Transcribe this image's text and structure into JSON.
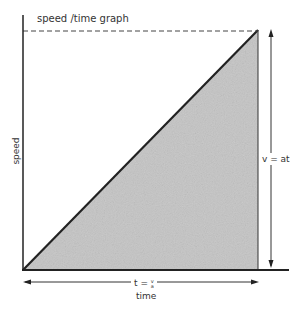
{
  "diagram": {
    "title": "speed /time graph",
    "y_axis_label": "speed",
    "x_axis_label": "time",
    "velocity_annotation": "v = at",
    "time_annotation_prefix": "t = ",
    "time_annotation_num": "v",
    "time_annotation_den": "a",
    "colors": {
      "line": "#222222",
      "fill": "#c4c4c4",
      "dashed": "#444444",
      "background": "#ffffff"
    }
  }
}
